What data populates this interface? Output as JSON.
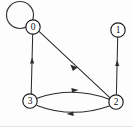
{
  "figure": {
    "width": 133,
    "height": 127,
    "background_color": "#fdfdfd",
    "node_stroke_color": "#1c1c1c",
    "node_fill_color": "#ffffff",
    "edge_color": "#2b2b2b",
    "label_color": "#111111"
  },
  "nodes": [
    {
      "id": "0",
      "label": "0",
      "cx": 33,
      "cy": 27,
      "r": 7.2
    },
    {
      "id": "1",
      "label": "1",
      "cx": 118,
      "cy": 30,
      "r": 7.2
    },
    {
      "id": "2",
      "label": "2",
      "cx": 116,
      "cy": 102,
      "r": 7.2
    },
    {
      "id": "3",
      "label": "3",
      "cx": 30,
      "cy": 101,
      "r": 7.2
    }
  ],
  "edges": [
    {
      "id": "e-0-0",
      "from": "0",
      "to": "0",
      "kind": "self-loop",
      "arrow": "none"
    },
    {
      "id": "e-3-0",
      "from": "3",
      "to": "0",
      "kind": "straight",
      "arrow": "up"
    },
    {
      "id": "e-0-2",
      "from": "0",
      "to": "2",
      "kind": "straight",
      "arrow": "down-right"
    },
    {
      "id": "e-2-1",
      "from": "2",
      "to": "1",
      "kind": "straight",
      "arrow": "up"
    },
    {
      "id": "e-3-2",
      "from": "3",
      "to": "2",
      "kind": "curve-top",
      "arrow": "right"
    },
    {
      "id": "e-2-3",
      "from": "2",
      "to": "3",
      "kind": "curve-bottom",
      "arrow": "left"
    }
  ]
}
